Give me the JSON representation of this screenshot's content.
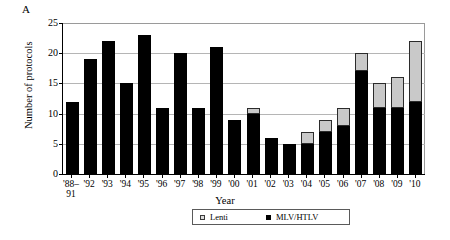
{
  "panel": {
    "label": "A"
  },
  "legend": {
    "lenti_label": "Lenti",
    "mlv_label": "MLV/HTLV",
    "lenti_color": "#dcdcdc",
    "mlv_color": "#000000"
  },
  "chart_data": {
    "type": "bar",
    "stacked": true,
    "title": "",
    "xlabel": "Year",
    "ylabel": "Number of protocols",
    "ylim": [
      0,
      25
    ],
    "yticks": [
      0,
      5,
      10,
      15,
      20,
      25
    ],
    "grid": true,
    "legend_position": "bottom",
    "categories": [
      "'88–\n91",
      "'92",
      "'93",
      "'94",
      "'95",
      "'96",
      "'97",
      "'98",
      "'99",
      "'00",
      "'01",
      "'02",
      "'03",
      "'04",
      "'05",
      "'06",
      "'07",
      "'08",
      "'09",
      "'10"
    ],
    "series": [
      {
        "name": "MLV/HTLV",
        "color": "#000000",
        "values": [
          12,
          19,
          22,
          15,
          23,
          11,
          20,
          11,
          21,
          9,
          10,
          6,
          5,
          5,
          7,
          8,
          17,
          11,
          11,
          12
        ]
      },
      {
        "name": "Lenti",
        "color": "#dcdcdc",
        "values": [
          0,
          0,
          0,
          0,
          0,
          0,
          0,
          0,
          0,
          0,
          1,
          0,
          0,
          2,
          2,
          3,
          3,
          4,
          5,
          10
        ]
      }
    ],
    "totals": [
      12,
      19,
      22,
      15,
      23,
      11,
      20,
      11,
      21,
      9,
      11,
      6,
      5,
      7,
      9,
      11,
      20,
      15,
      16,
      22
    ]
  }
}
